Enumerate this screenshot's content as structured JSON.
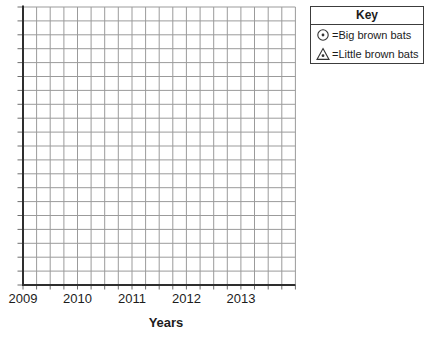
{
  "colors": {
    "grid_line": "#9b9b9b",
    "tick": "#6e6e6e",
    "axis": "#2e2e2e",
    "key_border": "#3c3c3c",
    "text": "#1c1c1c",
    "background": "#ffffff"
  },
  "legend": {
    "title": "Key",
    "items": [
      {
        "icon": "circle-dot-marker",
        "label": "=Big brown bats"
      },
      {
        "icon": "triangle-dot-marker",
        "label": "=Little brown bats"
      }
    ]
  },
  "chart_data": {
    "type": "scatter",
    "title": "",
    "xlabel": "Years",
    "ylabel": "",
    "x_tick_labels": [
      "2009",
      "2010",
      "2011",
      "2012",
      "2013"
    ],
    "grid": {
      "columns": 20,
      "rows": 20,
      "cells_per_label": 4,
      "show_grid": true
    },
    "series": [
      {
        "name": "Big brown bats",
        "marker": "circle-with-center-dot",
        "points": []
      },
      {
        "name": "Little brown bats",
        "marker": "triangle-with-center-dot",
        "points": []
      }
    ],
    "legend_position": "top-right-outside"
  }
}
